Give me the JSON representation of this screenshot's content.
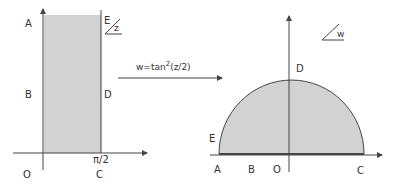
{
  "colors": {
    "background": "#ffffff",
    "fill": "#d2d2d2",
    "stroke": "#444444",
    "text": "#333333"
  },
  "left_diagram": {
    "plane_label": "z",
    "labels": {
      "A": "A",
      "B": "B",
      "D": "D",
      "E": "E",
      "O": "O",
      "C": "C",
      "pi_half": "π/2"
    }
  },
  "mapping": {
    "formula_prefix": "w=tan",
    "formula_exp": "2",
    "formula_suffix": "(z/2)"
  },
  "right_diagram": {
    "plane_label": "w",
    "labels": {
      "D": "D",
      "E": "E",
      "A": "A",
      "B": "B",
      "O": "O",
      "C": "C"
    }
  }
}
